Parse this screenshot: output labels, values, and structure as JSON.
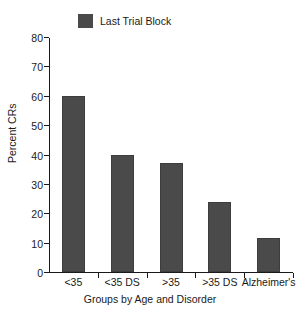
{
  "chart_data": {
    "type": "bar",
    "title": "",
    "categories": [
      "<35",
      "<35 DS",
      ">35",
      ">35 DS",
      "Alzheimer's"
    ],
    "values": [
      60,
      40,
      37,
      24,
      11.5
    ],
    "series": [
      {
        "name": "Last Trial Block",
        "values": [
          60,
          40,
          37,
          24,
          11.5
        ]
      }
    ],
    "xlabel": "Groups by Age and Disorder",
    "ylabel": "Percent CRs",
    "ylim": [
      0,
      80
    ],
    "yticks": [
      0,
      10,
      20,
      30,
      40,
      50,
      60,
      70,
      80
    ],
    "ytick_labels": [
      "0",
      "10",
      "20",
      "30",
      "40",
      "50",
      "60",
      "70",
      "80"
    ],
    "grid": false,
    "legend": {
      "position": "top-left",
      "entries": [
        {
          "label": "Last Trial Block",
          "color": "#4a4a4a"
        }
      ]
    },
    "bar_color": "#4a4a4a",
    "axis_color": "#1a1a1a"
  }
}
